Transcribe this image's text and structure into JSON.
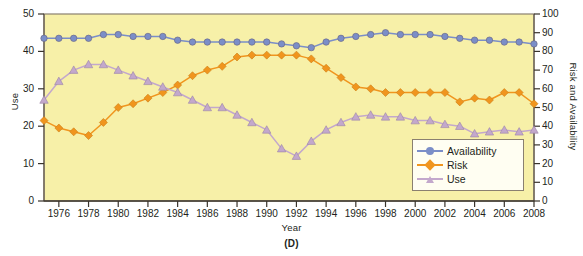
{
  "figure": {
    "panel_label": "(D)",
    "background_color": "#f7f0a8",
    "plot_border_color": "#8a8070"
  },
  "chart_data": {
    "type": "line",
    "title": "",
    "subtitle": "",
    "xlabel": "Year",
    "ylabel": "Use",
    "y2label": "Risk and Availability",
    "xlim": [
      1975,
      2008
    ],
    "ylim": [
      0,
      50
    ],
    "y2lim": [
      0,
      100
    ],
    "grid": false,
    "legend_position": "bottom-right",
    "x_ticks": [
      1976,
      1978,
      1980,
      1982,
      1984,
      1986,
      1988,
      1990,
      1992,
      1994,
      1996,
      1998,
      2000,
      2002,
      2004,
      2006,
      2008
    ],
    "y_ticks": [
      0,
      10,
      20,
      30,
      40,
      50
    ],
    "y2_ticks": [
      0,
      10,
      20,
      30,
      40,
      50,
      60,
      70,
      80,
      90,
      100
    ],
    "x": [
      1975,
      1976,
      1977,
      1978,
      1979,
      1980,
      1981,
      1982,
      1983,
      1984,
      1985,
      1986,
      1987,
      1988,
      1989,
      1990,
      1991,
      1992,
      1993,
      1994,
      1995,
      1996,
      1997,
      1998,
      1999,
      2000,
      2001,
      2002,
      2003,
      2004,
      2005,
      2006,
      2007,
      2008
    ],
    "series": [
      {
        "name": "Availability",
        "color": "#7b8ec8",
        "marker": "circle",
        "axis": "right",
        "values": [
          87,
          87,
          87,
          87,
          89,
          89,
          88,
          88,
          88,
          86,
          85,
          85,
          85,
          85,
          85,
          85,
          84,
          83,
          82,
          85,
          87,
          88,
          89,
          90,
          89,
          89,
          89,
          88,
          87,
          86,
          86,
          85,
          85,
          84
        ]
      },
      {
        "name": "Risk",
        "color": "#f0951e",
        "marker": "diamond",
        "axis": "right",
        "values": [
          43,
          39,
          37,
          35,
          42,
          50,
          52,
          55,
          58,
          62,
          67,
          70,
          72,
          77,
          78,
          78,
          78,
          78,
          76,
          71,
          66,
          61,
          60,
          58,
          58,
          58,
          58,
          58,
          53,
          55,
          54,
          58,
          58,
          52
        ]
      },
      {
        "name": "Use",
        "color": "#c3a8cc",
        "marker": "triangle",
        "axis": "left",
        "values": [
          27,
          32,
          35,
          36.5,
          36.5,
          35,
          33.5,
          32,
          30.5,
          29,
          27,
          25,
          25,
          23,
          21,
          19,
          14,
          12,
          16,
          19,
          21,
          22.5,
          23,
          22.5,
          22.5,
          21.5,
          21.5,
          20.5,
          20,
          18,
          18.5,
          19,
          18.5,
          19
        ]
      }
    ]
  },
  "legend": {
    "entries": [
      {
        "label": "Availability"
      },
      {
        "label": "Risk"
      },
      {
        "label": "Use"
      }
    ]
  }
}
